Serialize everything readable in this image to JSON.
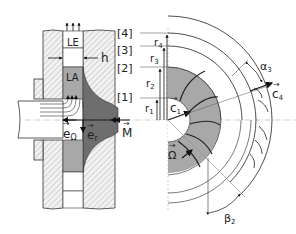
{
  "diagram": {
    "type": "centrifugal-pump-impeller-schematic",
    "cross_section": {
      "regions": [
        {
          "id": "LE",
          "label": "LE"
        },
        {
          "id": "LA",
          "label": "LA"
        }
      ],
      "gap_label": "h",
      "station_labels": [
        "[1]",
        "[2]",
        "[3]",
        "[4]"
      ],
      "vectors": [
        {
          "id": "e_omega",
          "label": "e",
          "subscript": "Ω"
        },
        {
          "id": "e_r",
          "label": "e",
          "subscript": "r"
        },
        {
          "id": "M",
          "label": "M"
        }
      ]
    },
    "front_view": {
      "radius_labels": [
        {
          "id": "r1",
          "label": "r",
          "subscript": "1"
        },
        {
          "id": "r2",
          "label": "r",
          "subscript": "2"
        },
        {
          "id": "r3",
          "label": "r",
          "subscript": "3"
        },
        {
          "id": "r4",
          "label": "r",
          "subscript": "4"
        }
      ],
      "velocity_labels": [
        {
          "id": "c1",
          "label": "c",
          "subscript": "1"
        },
        {
          "id": "c4",
          "label": "c",
          "subscript": "4"
        }
      ],
      "rotation_label": "Ω",
      "angle_labels": [
        {
          "id": "alpha3",
          "label": "α",
          "subscript": "3"
        },
        {
          "id": "beta2",
          "label": "β",
          "subscript": "2"
        }
      ]
    },
    "colors": {
      "line": "#222222",
      "impeller_dark": "#6e6e6e",
      "impeller_light": "#a8a8a8",
      "hatch": "#9a9a9a",
      "axis": "#aaaaaa"
    }
  }
}
